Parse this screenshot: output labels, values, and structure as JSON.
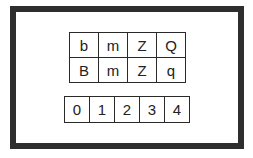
{
  "frame": {
    "border_color": "#2e2e2e",
    "background": "#ffffff"
  },
  "letter_grid": {
    "rows": [
      [
        "b",
        "m",
        "Z",
        "Q"
      ],
      [
        "B",
        "m",
        "Z",
        "q"
      ]
    ]
  },
  "digit_row": {
    "cells": [
      "0",
      "1",
      "2",
      "3",
      "4"
    ]
  }
}
